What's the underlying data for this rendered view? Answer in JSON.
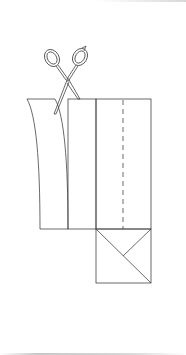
{
  "diagram": {
    "stroke_color": "#444444",
    "background_color": "#ffffff",
    "elements": [
      {
        "name": "scissors-icon",
        "description": "scissors cutting a strip"
      },
      {
        "name": "curved-strip",
        "description": "strip being cut away"
      },
      {
        "name": "panel-1",
        "description": "narrow rectangle"
      },
      {
        "name": "panel-2",
        "description": "rectangle with dashed fold line"
      },
      {
        "name": "dashed-fold-line",
        "description": "vertical dashed line"
      },
      {
        "name": "square-with-diagonals",
        "description": "square folded corner"
      }
    ]
  }
}
